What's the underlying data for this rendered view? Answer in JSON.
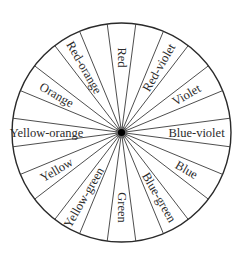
{
  "diagram": {
    "type": "color-wheel",
    "sector_count": 24,
    "labeled_sectors": [
      {
        "name": "Red",
        "position": "top"
      },
      {
        "name": "Red-violet"
      },
      {
        "name": "Violet"
      },
      {
        "name": "Blue-violet",
        "position": "right"
      },
      {
        "name": "Blue"
      },
      {
        "name": "Blue-green"
      },
      {
        "name": "Green",
        "position": "bottom"
      },
      {
        "name": "Yellow-green"
      },
      {
        "name": "Yellow"
      },
      {
        "name": "Yellow-orange",
        "position": "left"
      },
      {
        "name": "Orange"
      },
      {
        "name": "Red-orange"
      }
    ],
    "label_order": "clockwise from top, alternating with unlabeled sectors",
    "colors": {
      "line": "#3a3a3a",
      "rim": "#2a2a2a",
      "text": "#2b2b2b",
      "hub": "#000000",
      "background": "#ffffff"
    }
  }
}
